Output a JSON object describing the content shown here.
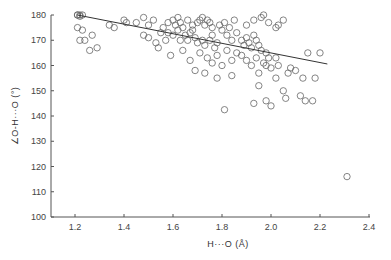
{
  "chart_data": {
    "type": "scatter",
    "title": "",
    "xlabel": "H···O (Å)",
    "ylabel": "∠O-H···O (°)",
    "xlim": [
      1.1,
      2.4
    ],
    "ylim": [
      100,
      180
    ],
    "xticks": [
      1.2,
      1.4,
      1.6,
      1.8,
      2.0,
      2.2,
      2.4
    ],
    "xtick_labels": [
      "1.2",
      "1.4",
      "1.6",
      "1.8",
      "2.0",
      "2.2",
      "2.4"
    ],
    "yticks": [
      100,
      110,
      120,
      130,
      140,
      150,
      160,
      170,
      180
    ],
    "ytick_labels": [
      "100",
      "110",
      "120",
      "130",
      "140",
      "150",
      "160",
      "170",
      "180"
    ],
    "grid": false,
    "legend": null,
    "marker": "open-circle",
    "regression_line": {
      "x": [
        1.21,
        2.23
      ],
      "y": [
        180.0,
        160.6
      ]
    },
    "series": [
      {
        "name": "hydrogen bonds",
        "points": [
          [
            1.21,
            180
          ],
          [
            1.22,
            180
          ],
          [
            1.23,
            180
          ],
          [
            1.21,
            180
          ],
          [
            1.22,
            179.5
          ],
          [
            1.21,
            175
          ],
          [
            1.23,
            174
          ],
          [
            1.27,
            172
          ],
          [
            1.22,
            170
          ],
          [
            1.24,
            170
          ],
          [
            1.34,
            176
          ],
          [
            1.36,
            175
          ],
          [
            1.4,
            178
          ],
          [
            1.41,
            177
          ],
          [
            1.45,
            177
          ],
          [
            1.48,
            179
          ],
          [
            1.5,
            176
          ],
          [
            1.52,
            178
          ],
          [
            1.5,
            171
          ],
          [
            1.53,
            169
          ],
          [
            1.55,
            173
          ],
          [
            1.57,
            170
          ],
          [
            1.6,
            178
          ],
          [
            1.61,
            176
          ],
          [
            1.62,
            179
          ],
          [
            1.63,
            177
          ],
          [
            1.58,
            173
          ],
          [
            1.6,
            172
          ],
          [
            1.62,
            174
          ],
          [
            1.64,
            175
          ],
          [
            1.65,
            172
          ],
          [
            1.66,
            170
          ],
          [
            1.67,
            173
          ],
          [
            1.68,
            176
          ],
          [
            1.66,
            178
          ],
          [
            1.7,
            177
          ],
          [
            1.71,
            178
          ],
          [
            1.72,
            179
          ],
          [
            1.73,
            176
          ],
          [
            1.74,
            178
          ],
          [
            1.75,
            177
          ],
          [
            1.76,
            175
          ],
          [
            1.69,
            171
          ],
          [
            1.7,
            169
          ],
          [
            1.72,
            170
          ],
          [
            1.73,
            168
          ],
          [
            1.75,
            170
          ],
          [
            1.76,
            172
          ],
          [
            1.77,
            167
          ],
          [
            1.78,
            169
          ],
          [
            1.79,
            176
          ],
          [
            1.8,
            174
          ],
          [
            1.81,
            177
          ],
          [
            1.82,
            172
          ],
          [
            1.83,
            175
          ],
          [
            1.84,
            170
          ],
          [
            1.85,
            178
          ],
          [
            1.86,
            173
          ],
          [
            1.71,
            165
          ],
          [
            1.74,
            163
          ],
          [
            1.76,
            161
          ],
          [
            1.78,
            164
          ],
          [
            1.8,
            160
          ],
          [
            1.82,
            166
          ],
          [
            1.84,
            162
          ],
          [
            1.86,
            165
          ],
          [
            1.88,
            170
          ],
          [
            1.89,
            168
          ],
          [
            1.9,
            171
          ],
          [
            1.91,
            169
          ],
          [
            1.92,
            167
          ],
          [
            1.93,
            172
          ],
          [
            1.94,
            170
          ],
          [
            1.95,
            168
          ],
          [
            1.88,
            164
          ],
          [
            1.9,
            162
          ],
          [
            1.92,
            160
          ],
          [
            1.94,
            163
          ],
          [
            1.96,
            166
          ],
          [
            1.97,
            161
          ],
          [
            1.98,
            165
          ],
          [
            1.99,
            163
          ],
          [
            1.9,
            176
          ],
          [
            1.93,
            178
          ],
          [
            1.96,
            179
          ],
          [
            1.99,
            177
          ],
          [
            2.02,
            175
          ],
          [
            2.05,
            178
          ],
          [
            1.97,
            180
          ],
          [
            2.03,
            176
          ],
          [
            1.59,
            164
          ],
          [
            1.64,
            166
          ],
          [
            1.67,
            162
          ],
          [
            1.69,
            158
          ],
          [
            1.73,
            157
          ],
          [
            1.78,
            155
          ],
          [
            1.84,
            156
          ],
          [
            1.81,
            142.5
          ],
          [
            1.95,
            157
          ],
          [
            1.98,
            160
          ],
          [
            2.0,
            159
          ],
          [
            2.02,
            155
          ],
          [
            2.05,
            150
          ],
          [
            2.07,
            157
          ],
          [
            2.08,
            159
          ],
          [
            2.1,
            158
          ],
          [
            1.98,
            146
          ],
          [
            2.0,
            144
          ],
          [
            2.06,
            147
          ],
          [
            2.12,
            148
          ],
          [
            2.13,
            155
          ],
          [
            2.14,
            146
          ],
          [
            2.17,
            146
          ],
          [
            2.18,
            155
          ],
          [
            2.15,
            165
          ],
          [
            2.2,
            165
          ],
          [
            2.02,
            163
          ],
          [
            2.03,
            160
          ],
          [
            1.95,
            152
          ],
          [
            1.93,
            145
          ],
          [
            1.26,
            166
          ],
          [
            1.29,
            167
          ],
          [
            1.48,
            172
          ],
          [
            1.54,
            167
          ],
          [
            1.56,
            175
          ],
          [
            1.58,
            177
          ],
          [
            1.63,
            170
          ],
          [
            1.68,
            174
          ],
          [
            2.31,
            116
          ]
        ]
      }
    ]
  }
}
